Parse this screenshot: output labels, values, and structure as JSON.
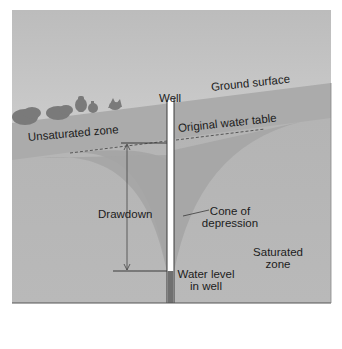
{
  "diagram": {
    "labels": {
      "well": "Well",
      "ground_surface": "Ground surface",
      "unsaturated_zone": "Unsaturated zone",
      "original_water_table": "Original water table",
      "drawdown": "Drawdown",
      "cone_of_depression_line1": "Cone of",
      "cone_of_depression_line2": "depression",
      "saturated_zone_line1": "Saturated",
      "saturated_zone_line2": "zone",
      "water_level_line1": "Water level",
      "water_level_line2": "in well"
    },
    "colors": {
      "sky_top": "#bdbdbd",
      "sky_bottom": "#dedede",
      "unsaturated": "#a9a9a9",
      "saturated": "#b7b7b7",
      "cone": "#9e9e9e",
      "well_bore": "#ffffff",
      "well_water": "#6f6f6f",
      "lines": "#3a3a3a"
    }
  }
}
